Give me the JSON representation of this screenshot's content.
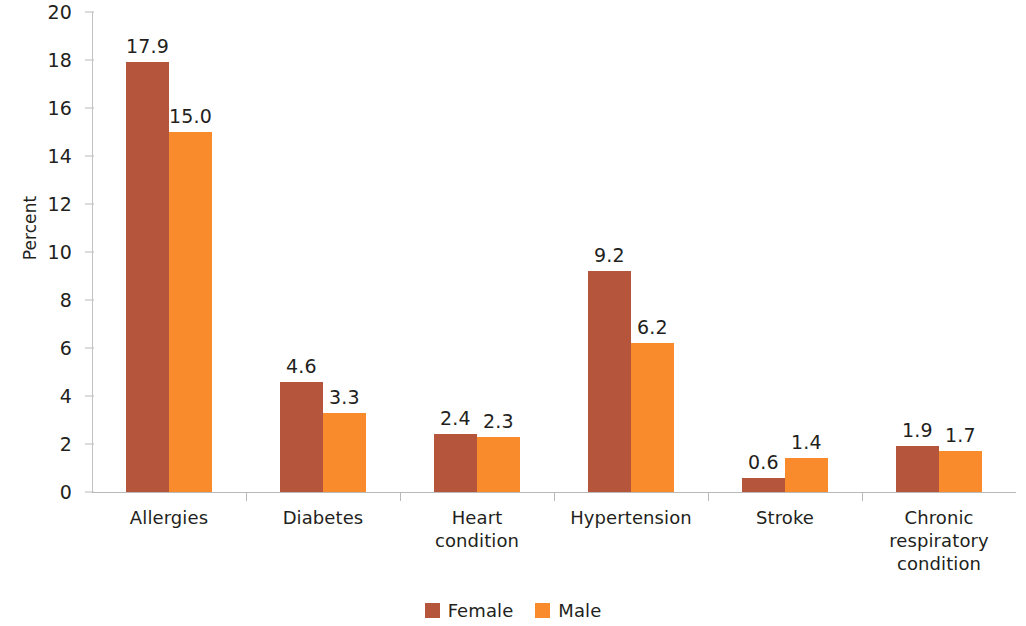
{
  "chart_data": {
    "type": "bar",
    "title": "",
    "subtitle": "",
    "xlabel": "",
    "ylabel": "Percent",
    "ylim": [
      0,
      20
    ],
    "ytick_step": 2,
    "yticks": [
      "20",
      "18",
      "16",
      "14",
      "12",
      "10",
      "8",
      "6",
      "4",
      "2",
      "0"
    ],
    "grid": false,
    "legend_position": "bottom-center",
    "categories": [
      "Allergies",
      "Diabetes",
      "Heart\ncondition",
      "Hypertension",
      "Stroke",
      "Chronic\nrespiratory\ncondition"
    ],
    "series": [
      {
        "name": "Female",
        "color": "#B5553C",
        "values": [
          17.9,
          4.6,
          2.4,
          9.2,
          0.6,
          1.9
        ],
        "labels": [
          "17.9",
          "4.6",
          "2.4",
          "9.2",
          "0.6",
          "1.9"
        ]
      },
      {
        "name": "Male",
        "color": "#F98B2C",
        "values": [
          15.0,
          3.3,
          2.3,
          6.2,
          1.4,
          1.7
        ],
        "labels": [
          "15.0",
          "3.3",
          "2.3",
          "6.2",
          "1.4",
          "1.7"
        ]
      }
    ]
  },
  "legend": {
    "items": [
      {
        "label": "Female",
        "color": "#B5553C"
      },
      {
        "label": "Male",
        "color": "#F98B2C"
      }
    ]
  },
  "axis": {
    "y_title": "Percent"
  }
}
